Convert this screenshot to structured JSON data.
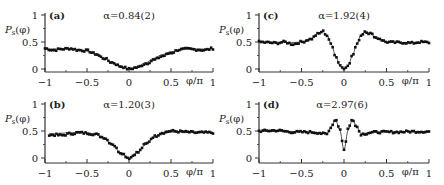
{
  "figure": {
    "x_axis_label": "φ/π",
    "y_axis_label_main": "P",
    "y_axis_label_sub": "s",
    "y_axis_label_arg": "(φ)",
    "x_ticks": [
      "−1",
      "−0.5",
      "0",
      "0.5",
      "1"
    ],
    "y_ticks": [
      "0",
      "0.5",
      "1"
    ],
    "panels": [
      {
        "id": "a",
        "label": "(a)",
        "alpha": "α=0.84(2)"
      },
      {
        "id": "b",
        "label": "(b)",
        "alpha": "α=1.20(3)"
      },
      {
        "id": "c",
        "label": "(c)",
        "alpha": "α=1.92(4)"
      },
      {
        "id": "d",
        "label": "(d)",
        "alpha": "α=2.97(6)"
      }
    ]
  },
  "chart_data": [
    {
      "type": "scatter",
      "title": "(a) α=0.84(2)",
      "xlabel": "φ/π",
      "ylabel": "P_s(φ)",
      "xlim": [
        -1,
        1
      ],
      "ylim": [
        0,
        1
      ],
      "x": [
        -1.0,
        -0.9,
        -0.8,
        -0.7,
        -0.6,
        -0.5,
        -0.4,
        -0.3,
        -0.2,
        -0.1,
        0.0,
        0.1,
        0.2,
        0.3,
        0.4,
        0.5,
        0.6,
        0.7,
        0.8,
        0.9,
        1.0
      ],
      "series": [
        {
          "name": "data",
          "values": [
            0.38,
            0.35,
            0.37,
            0.38,
            0.35,
            0.34,
            0.28,
            0.2,
            0.12,
            0.05,
            0.0,
            0.03,
            0.1,
            0.17,
            0.24,
            0.3,
            0.36,
            0.37,
            0.36,
            0.35,
            0.38
          ]
        },
        {
          "name": "fit",
          "values": [
            0.37,
            0.37,
            0.37,
            0.37,
            0.36,
            0.33,
            0.27,
            0.2,
            0.12,
            0.04,
            0.0,
            0.04,
            0.12,
            0.2,
            0.27,
            0.32,
            0.35,
            0.37,
            0.37,
            0.37,
            0.37
          ]
        }
      ]
    },
    {
      "type": "scatter",
      "title": "(b) α=1.20(3)",
      "xlabel": "φ/π",
      "ylabel": "P_s(φ)",
      "xlim": [
        -1,
        1
      ],
      "ylim": [
        0,
        1
      ],
      "x": [
        -0.95,
        -0.9,
        -0.8,
        -0.7,
        -0.6,
        -0.5,
        -0.4,
        -0.3,
        -0.2,
        -0.1,
        0.0,
        0.1,
        0.2,
        0.3,
        0.4,
        0.5,
        0.6,
        0.7,
        0.8,
        0.9,
        1.0
      ],
      "series": [
        {
          "name": "data",
          "values": [
            0.42,
            0.43,
            0.42,
            0.45,
            0.47,
            0.46,
            0.44,
            0.38,
            0.26,
            0.1,
            0.0,
            0.1,
            0.26,
            0.4,
            0.47,
            0.5,
            0.49,
            0.48,
            0.47,
            0.47,
            0.47
          ]
        },
        {
          "name": "fit",
          "values": [
            0.45,
            0.45,
            0.46,
            0.47,
            0.47,
            0.47,
            0.44,
            0.37,
            0.25,
            0.1,
            0.0,
            0.1,
            0.25,
            0.38,
            0.45,
            0.48,
            0.48,
            0.47,
            0.47,
            0.47,
            0.47
          ]
        }
      ]
    },
    {
      "type": "scatter",
      "title": "(c) α=1.92(4)",
      "xlabel": "φ/π",
      "ylabel": "P_s(φ)",
      "xlim": [
        -1,
        1
      ],
      "ylim": [
        0,
        1
      ],
      "x": [
        -1.0,
        -0.9,
        -0.8,
        -0.7,
        -0.6,
        -0.5,
        -0.4,
        -0.3,
        -0.25,
        -0.2,
        -0.15,
        -0.1,
        -0.05,
        0.0,
        0.05,
        0.1,
        0.15,
        0.2,
        0.25,
        0.3,
        0.4,
        0.5,
        0.6,
        0.7,
        0.8,
        0.9,
        1.0
      ],
      "series": [
        {
          "name": "data",
          "values": [
            0.5,
            0.49,
            0.48,
            0.5,
            0.46,
            0.5,
            0.55,
            0.65,
            0.7,
            0.62,
            0.45,
            0.25,
            0.08,
            0.0,
            0.08,
            0.25,
            0.45,
            0.62,
            0.7,
            0.66,
            0.57,
            0.5,
            0.49,
            0.49,
            0.48,
            0.5,
            0.49
          ]
        },
        {
          "name": "fit",
          "values": [
            0.49,
            0.49,
            0.49,
            0.49,
            0.49,
            0.5,
            0.56,
            0.66,
            0.69,
            0.63,
            0.46,
            0.25,
            0.07,
            0.0,
            0.07,
            0.25,
            0.46,
            0.63,
            0.69,
            0.66,
            0.56,
            0.5,
            0.49,
            0.49,
            0.49,
            0.49,
            0.49
          ]
        }
      ]
    },
    {
      "type": "scatter",
      "title": "(d) α=2.97(6)",
      "xlabel": "φ/π",
      "ylabel": "P_s(φ)",
      "xlim": [
        -1,
        1
      ],
      "ylim": [
        0,
        1
      ],
      "x": [
        -1.0,
        -0.8,
        -0.6,
        -0.4,
        -0.3,
        -0.25,
        -0.2,
        -0.15,
        -0.1,
        -0.05,
        0.0,
        0.05,
        0.1,
        0.15,
        0.2,
        0.25,
        0.3,
        0.4,
        0.6,
        0.8,
        1.0
      ],
      "series": [
        {
          "name": "data",
          "values": [
            0.5,
            0.51,
            0.48,
            0.48,
            0.47,
            0.45,
            0.44,
            0.58,
            0.72,
            0.55,
            0.15,
            0.55,
            0.72,
            0.58,
            0.44,
            0.45,
            0.47,
            0.48,
            0.48,
            0.49,
            0.49
          ]
        },
        {
          "name": "fit",
          "values": [
            0.49,
            0.49,
            0.49,
            0.48,
            0.47,
            0.46,
            0.45,
            0.58,
            0.71,
            0.52,
            0.15,
            0.52,
            0.71,
            0.58,
            0.45,
            0.46,
            0.47,
            0.48,
            0.49,
            0.49,
            0.49
          ]
        }
      ]
    }
  ]
}
